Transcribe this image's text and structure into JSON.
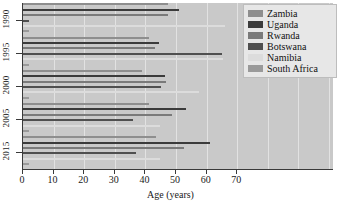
{
  "chart_data": {
    "type": "bar",
    "orientation": "horizontal",
    "title": "",
    "xlabel": "Age (years)",
    "ylabel": "",
    "xlim": [
      0,
      101.6
    ],
    "xticks": [
      0,
      10,
      20,
      30,
      40,
      50,
      60,
      70
    ],
    "xticklabels": [
      "0",
      "10",
      "20",
      "30",
      "40",
      "50",
      "60",
      "70"
    ],
    "categories": [
      "1990",
      "1995",
      "2000",
      "2005",
      "2015"
    ],
    "grid": true,
    "grid_axis": "x",
    "legend_position": "upper right",
    "series": [
      {
        "name": "Zambia",
        "color": "#8e8e8e",
        "values": [
          47.5,
          41.0,
          39.0,
          41.0,
          43.5
        ]
      },
      {
        "name": "Uganda",
        "color": "#3b3b3b",
        "values": [
          50.8,
          44.5,
          46.3,
          53.3,
          61.0
        ]
      },
      {
        "name": "Rwanda",
        "color": "#7a7a7a",
        "values": [
          47.5,
          43.2,
          46.8,
          48.7,
          52.5
        ]
      },
      {
        "name": "Botswana",
        "color": "#4f4f4f",
        "values": [
          2.0,
          65.0,
          45.0,
          35.8,
          36.8
        ]
      },
      {
        "name": "Namibia",
        "color": "#dcdcdc",
        "values": [
          66.0,
          65.5,
          57.5,
          44.8,
          44.8
        ]
      },
      {
        "name": "South Africa",
        "color": "#9a9a9a",
        "values": [
          2.0,
          2.0,
          2.0,
          2.0,
          2.0
        ]
      }
    ]
  },
  "legend": {
    "items": [
      {
        "label": "Zambia"
      },
      {
        "label": "Uganda"
      },
      {
        "label": "Rwanda"
      },
      {
        "label": "Botswana"
      },
      {
        "label": "Namibia"
      },
      {
        "label": "South Africa"
      }
    ]
  },
  "axes": {
    "x_title": "Age (years)",
    "x_tick_labels": [
      "0",
      "10",
      "20",
      "30",
      "40",
      "50",
      "60",
      "70"
    ],
    "y_tick_labels": [
      "1990",
      "1995",
      "2000",
      "2005",
      "2015"
    ]
  },
  "colors": {
    "panel_background": "#c9c9c9",
    "grid": "#e2e2e2",
    "axis": "#3a3a3a",
    "legend_background": "#e7e7e7",
    "legend_border": "#bdbdbd",
    "text": "#1a1a1a"
  }
}
